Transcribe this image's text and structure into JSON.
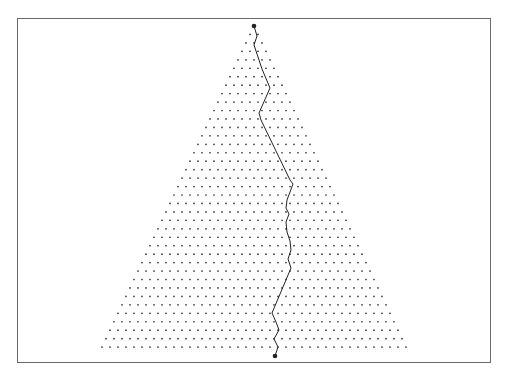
{
  "diagram": {
    "type": "random-walk-on-triangular-lattice",
    "frame": {
      "left": 17,
      "top": 18,
      "right": 492,
      "bottom": 364,
      "stroke": "#6a6a6a"
    },
    "lattice": {
      "apex_x": 254,
      "top_y": 26,
      "col_spacing": 8,
      "row_spacing": 8.45,
      "first_row": 1,
      "last_row": 38,
      "dot_radius": 0.85,
      "dot_color": "#333333"
    },
    "path": {
      "color": "#222222",
      "stroke_width": 1,
      "start_marker": {
        "x": 254,
        "y": 26
      },
      "end_marker": {
        "x": 275,
        "y": 356
      },
      "marker_radius": 2.3,
      "points": [
        [
          254,
          26
        ],
        [
          257,
          36
        ],
        [
          254,
          45
        ],
        [
          262,
          69
        ],
        [
          270,
          88
        ],
        [
          259,
          113
        ],
        [
          261,
          120
        ],
        [
          290,
          180
        ],
        [
          293,
          184
        ],
        [
          287,
          200
        ],
        [
          286,
          208
        ],
        [
          289,
          214
        ],
        [
          286,
          222
        ],
        [
          287,
          232
        ],
        [
          290,
          241
        ],
        [
          291,
          250
        ],
        [
          288,
          259
        ],
        [
          291,
          268
        ],
        [
          272,
          313
        ],
        [
          276,
          322
        ],
        [
          279,
          330
        ],
        [
          274,
          339
        ],
        [
          278,
          347
        ],
        [
          275,
          356
        ]
      ]
    }
  }
}
